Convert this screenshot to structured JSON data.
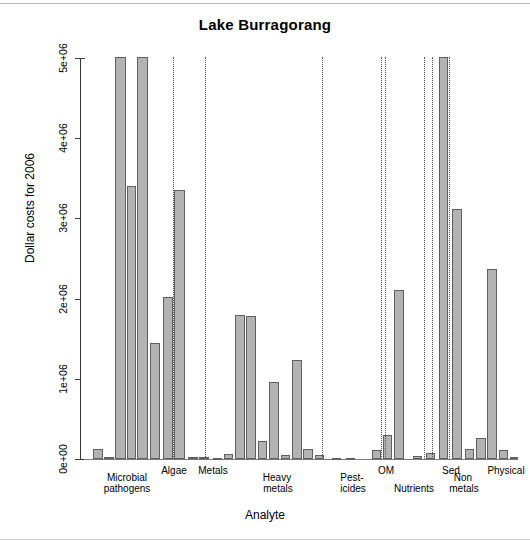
{
  "chart_data": {
    "type": "bar",
    "title": "Lake Burragorang",
    "xlabel": "Analyte",
    "ylabel": "Dollar costs for 2006",
    "ylim": [
      0,
      5200000
    ],
    "ytick_labels": [
      "0e+00",
      "1e+06",
      "2e+06",
      "3e+06",
      "4e+06",
      "5e+06"
    ],
    "ytick_values": [
      0,
      1000000,
      2000000,
      3000000,
      4000000,
      5000000
    ],
    "grid": false,
    "legend": "none",
    "group_labels": [
      "Microbial\npathogens",
      "Algae",
      "Metals",
      "Heavy\nmetals",
      "Pest-\nicides",
      "OM",
      "Nutrients",
      "Sed",
      "Non\nmetals",
      "Physical"
    ],
    "groups": [
      {
        "name": "Microbial pathogens",
        "values": [
          120000,
          30000,
          5100000,
          3400000,
          5100000,
          1450000
        ]
      },
      {
        "name": "Algae",
        "values": [
          2020000,
          3350000
        ]
      },
      {
        "name": "Metals",
        "values": [
          30000,
          20000,
          15000
        ]
      },
      {
        "name": "Heavy metals",
        "values": [
          70000,
          1790000,
          1780000,
          220000,
          960000,
          50000
        ]
      },
      {
        "name": "Heavy metals extra",
        "values": [
          1240000,
          130000,
          60000
        ]
      },
      {
        "name": "Pesticides",
        "values": [
          10000
        ]
      },
      {
        "name": "OM",
        "values": [
          110000,
          300000,
          2110000
        ]
      },
      {
        "name": "Nutrients",
        "values": [
          40000,
          70000
        ]
      },
      {
        "name": "Non metals",
        "values": [
          5100000,
          3120000
        ]
      },
      {
        "name": "Physical",
        "values": [
          120000,
          260000,
          2370000,
          110000,
          20000
        ]
      }
    ],
    "bars": [
      {
        "x": 93,
        "w": 10,
        "value": 120000
      },
      {
        "x": 104,
        "w": 10,
        "value": 25000
      },
      {
        "x": 115,
        "w": 11,
        "value": 5100000
      },
      {
        "x": 127,
        "w": 9,
        "value": 3400000
      },
      {
        "x": 137,
        "w": 11,
        "value": 5100000
      },
      {
        "x": 150,
        "w": 10,
        "value": 1450000
      },
      {
        "x": 163,
        "w": 10,
        "value": 2020000
      },
      {
        "x": 174,
        "w": 11,
        "value": 3350000
      },
      {
        "x": 188,
        "w": 10,
        "value": 30000
      },
      {
        "x": 199,
        "w": 10,
        "value": 20000
      },
      {
        "x": 213,
        "w": 9,
        "value": 18000
      },
      {
        "x": 224,
        "w": 9,
        "value": 60000
      },
      {
        "x": 235,
        "w": 10,
        "value": 1790000
      },
      {
        "x": 246,
        "w": 10,
        "value": 1780000
      },
      {
        "x": 258,
        "w": 9,
        "value": 220000
      },
      {
        "x": 269,
        "w": 10,
        "value": 960000
      },
      {
        "x": 281,
        "w": 9,
        "value": 45000
      },
      {
        "x": 292,
        "w": 10,
        "value": 1240000
      },
      {
        "x": 303,
        "w": 10,
        "value": 130000
      },
      {
        "x": 315,
        "w": 9,
        "value": 55000
      },
      {
        "x": 332,
        "w": 9,
        "value": 12000
      },
      {
        "x": 346,
        "w": 9,
        "value": 10000
      },
      {
        "x": 372,
        "w": 9,
        "value": 110000
      },
      {
        "x": 383,
        "w": 9,
        "value": 300000
      },
      {
        "x": 394,
        "w": 10,
        "value": 2110000
      },
      {
        "x": 413,
        "w": 9,
        "value": 40000
      },
      {
        "x": 426,
        "w": 9,
        "value": 70000
      },
      {
        "x": 439,
        "w": 9,
        "value": 5100000
      },
      {
        "x": 452,
        "w": 10,
        "value": 3120000
      },
      {
        "x": 465,
        "w": 9,
        "value": 125000
      },
      {
        "x": 476,
        "w": 10,
        "value": 260000
      },
      {
        "x": 487,
        "w": 10,
        "value": 2370000
      },
      {
        "x": 499,
        "w": 9,
        "value": 115000
      },
      {
        "x": 510,
        "w": 8,
        "value": 25000
      }
    ],
    "separators": [
      173,
      205,
      322,
      381,
      385,
      424,
      432,
      449
    ],
    "bar_fill_color": "#b3b3b3",
    "bar_border_color": "#606060",
    "axis_color": "#3a3a3a"
  },
  "labels": {
    "positions": [
      {
        "text": "Microbial",
        "x": 96,
        "y": 472,
        "w": 62
      },
      {
        "text": "pathogens",
        "x": 94,
        "y": 483,
        "w": 66
      },
      {
        "text": "Algae",
        "x": 156,
        "y": 465,
        "w": 36
      },
      {
        "text": "Metals",
        "x": 193,
        "y": 465,
        "w": 40
      },
      {
        "text": "Heavy",
        "x": 258,
        "y": 472,
        "w": 38
      },
      {
        "text": "metals",
        "x": 258,
        "y": 483,
        "w": 40
      },
      {
        "text": "Pest-",
        "x": 336,
        "y": 472,
        "w": 32
      },
      {
        "text": "icides",
        "x": 335,
        "y": 483,
        "w": 36
      },
      {
        "text": "OM",
        "x": 374,
        "y": 465,
        "w": 24
      },
      {
        "text": "Nutrients",
        "x": 386,
        "y": 483,
        "w": 56
      },
      {
        "text": "Sed",
        "x": 438,
        "y": 465,
        "w": 26
      },
      {
        "text": "Non",
        "x": 449,
        "y": 472,
        "w": 28
      },
      {
        "text": "metals",
        "x": 444,
        "y": 483,
        "w": 40
      },
      {
        "text": "Physical",
        "x": 481,
        "y": 465,
        "w": 50
      }
    ]
  }
}
